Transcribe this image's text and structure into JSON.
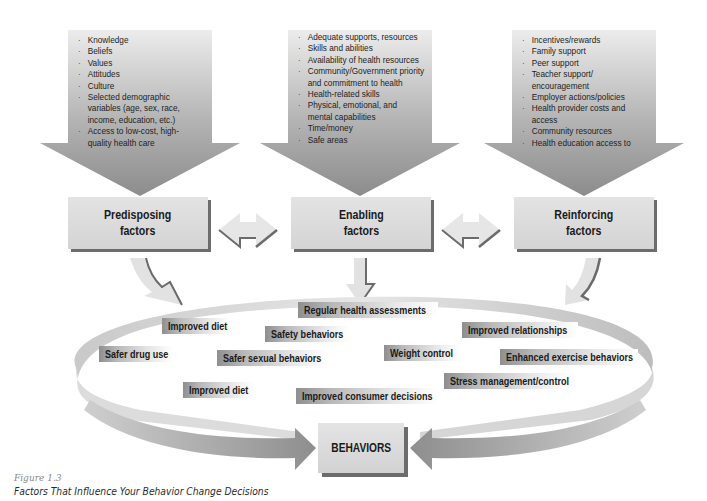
{
  "factors": [
    {
      "id": "predisposing",
      "title_line1": "Predisposing",
      "title_line2": "factors",
      "items": [
        "Knowledge",
        "Beliefs",
        "Values",
        "Attitudes",
        "Culture",
        "Selected demographic variables (age, sex, race, income, education, etc.)",
        "Access to low-cost, high-quality health care"
      ]
    },
    {
      "id": "enabling",
      "title_line1": "Enabling",
      "title_line2": "factors",
      "items": [
        "Adequate supports, resources",
        "Skills and abilities",
        "Availability of health resources",
        "Community/Government priority and commitment to health",
        "Health-related skills",
        "Physical, emotional, and mental capabilities",
        "Time/money",
        "Safe areas"
      ]
    },
    {
      "id": "reinforcing",
      "title_line1": "Reinforcing",
      "title_line2": "factors",
      "items": [
        "Incentives/rewards",
        "Family support",
        "Peer support",
        "Teacher support/ encouragement",
        "Employer actions/policies",
        "Health provider costs and access",
        "Community resources",
        "Health education access to"
      ]
    }
  ],
  "behavior_labels": [
    "Regular health assessments",
    "Improved diet",
    "Safety behaviors",
    "Improved relationships",
    "Safer drug use",
    "Safer sexual behaviors",
    "Weight control",
    "Enhanced exercise behaviors",
    "Improved diet",
    "Improved consumer decisions",
    "Stress management/control"
  ],
  "behaviors_box": "BEHAVIORS",
  "caption": {
    "figure_number": "Figure 1.3",
    "title": "Factors That Influence Your Behavior Change Decisions"
  },
  "colors": {
    "arrow_light": "#ececec",
    "arrow_dark": "#8a8a8a",
    "box_fill": "#dcdcdc",
    "box_shadow": "#6c6c6c",
    "text": "#1a1a1a"
  }
}
